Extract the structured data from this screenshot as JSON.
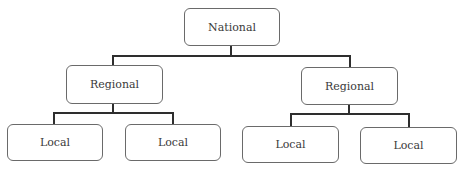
{
  "diagram": {
    "type": "hierarchy-tree",
    "root": {
      "label": "National",
      "children": [
        {
          "label": "Regional",
          "children": [
            {
              "label": "Local"
            },
            {
              "label": "Local"
            }
          ]
        },
        {
          "label": "Regional",
          "children": [
            {
              "label": "Local"
            },
            {
              "label": "Local"
            }
          ]
        }
      ]
    },
    "colors": {
      "connector": "#2e2e2e",
      "node_border": "#6a6a6a",
      "text": "#3a3a3a",
      "background": "#ffffff"
    }
  }
}
